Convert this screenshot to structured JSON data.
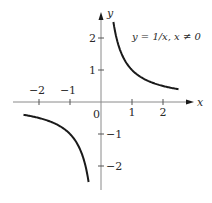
{
  "chart_data": {
    "type": "line",
    "title": "y = 1/x, x ≠ 0",
    "xlabel": "x",
    "ylabel": "y",
    "xlim": [
      -3.1,
      3.3
    ],
    "ylim": [
      -3.0,
      3.2
    ],
    "grid": false,
    "x_ticks": [
      -2,
      -1,
      1,
      2
    ],
    "x_tick_labels": [
      "−2",
      "−1",
      "1",
      "2"
    ],
    "y_ticks": [
      2,
      1,
      -1,
      -2
    ],
    "y_tick_labels": [
      "2",
      "1",
      "−1",
      "−2"
    ],
    "origin_label": "0",
    "series": [
      {
        "name": "positive branch",
        "function": "1/x",
        "x_range": [
          0.4,
          2.5
        ],
        "x": [
          0.4,
          0.5,
          0.75,
          1,
          1.5,
          2,
          2.5
        ],
        "values": [
          2.5,
          2,
          1.333,
          1,
          0.667,
          0.5,
          0.4
        ]
      },
      {
        "name": "negative branch",
        "function": "1/x",
        "x_range": [
          -2.5,
          -0.4
        ],
        "x": [
          -2.5,
          -2,
          -1.5,
          -1,
          -0.75,
          -0.5,
          -0.4
        ],
        "values": [
          -0.4,
          -0.5,
          -0.667,
          -1,
          -1.333,
          -2,
          -2.5
        ]
      }
    ],
    "colors": {
      "curve": "#1a1a1a",
      "axis": "#777777",
      "text": "#2a2a2a"
    }
  }
}
